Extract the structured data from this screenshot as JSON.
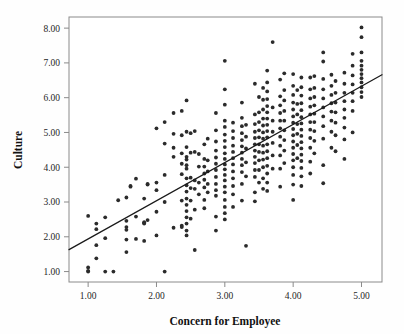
{
  "chart_data": {
    "type": "scatter",
    "title": "",
    "xlabel": "Concern for Employee",
    "ylabel": "Culture",
    "xlim": [
      0.72,
      5.3
    ],
    "ylim": [
      0.7,
      8.32
    ],
    "xticks": [
      1.0,
      2.0,
      3.0,
      4.0,
      5.0
    ],
    "xtick_labels": [
      "1.00",
      "2.00",
      "3.00",
      "4.00",
      "5.00"
    ],
    "yticks": [
      1.0,
      2.0,
      3.0,
      4.0,
      5.0,
      6.0,
      7.0,
      8.0
    ],
    "ytick_labels": [
      "1.00",
      "2.00",
      "3.00",
      "4.00",
      "5.00",
      "6.00",
      "7.00",
      "8.00"
    ],
    "grid": false,
    "legend": "none",
    "marker": {
      "shape": "circle",
      "size": 2.6,
      "color": "#2b2b2b"
    },
    "fit_line": {
      "type": "linear",
      "color": "#1a1a1a",
      "x_start": 0.72,
      "y_start": 1.63,
      "x_end": 5.3,
      "y_end": 6.66,
      "slope": 1.098,
      "intercept": 0.84
    },
    "points": [
      [
        1.0,
        2.6
      ],
      [
        1.0,
        1.12
      ],
      [
        1.0,
        1.02
      ],
      [
        1.0,
        1.0
      ],
      [
        1.12,
        2.38
      ],
      [
        1.12,
        2.22
      ],
      [
        1.12,
        1.76
      ],
      [
        1.12,
        1.38
      ],
      [
        1.25,
        2.56
      ],
      [
        1.25,
        1.96
      ],
      [
        1.25,
        1.0
      ],
      [
        1.37,
        1.0
      ],
      [
        1.44,
        3.05
      ],
      [
        1.56,
        3.13
      ],
      [
        1.56,
        2.46
      ],
      [
        1.56,
        2.28
      ],
      [
        1.56,
        2.2
      ],
      [
        1.56,
        1.92
      ],
      [
        1.56,
        1.56
      ],
      [
        1.62,
        3.46
      ],
      [
        1.62,
        3.44
      ],
      [
        1.7,
        3.67
      ],
      [
        1.7,
        2.58
      ],
      [
        1.7,
        1.94
      ],
      [
        1.82,
        3.1
      ],
      [
        1.82,
        2.42
      ],
      [
        1.82,
        2.4
      ],
      [
        1.82,
        2.38
      ],
      [
        1.82,
        1.88
      ],
      [
        1.87,
        3.52
      ],
      [
        1.87,
        3.5
      ],
      [
        1.87,
        2.48
      ],
      [
        2.0,
        5.12
      ],
      [
        2.0,
        3.56
      ],
      [
        2.0,
        3.34
      ],
      [
        2.0,
        2.72
      ],
      [
        2.0,
        2.04
      ],
      [
        2.12,
        5.3
      ],
      [
        2.12,
        4.68
      ],
      [
        2.12,
        3.78
      ],
      [
        2.12,
        3.0
      ],
      [
        2.12,
        1.0
      ],
      [
        2.25,
        5.56
      ],
      [
        2.25,
        4.96
      ],
      [
        2.25,
        4.56
      ],
      [
        2.25,
        4.3
      ],
      [
        2.25,
        2.26
      ],
      [
        2.37,
        5.62
      ],
      [
        2.37,
        4.92
      ],
      [
        2.37,
        4.4
      ],
      [
        2.37,
        4.1
      ],
      [
        2.37,
        3.8
      ],
      [
        2.37,
        3.04
      ],
      [
        2.37,
        2.32
      ],
      [
        2.37,
        2.28
      ],
      [
        2.44,
        5.92
      ],
      [
        2.44,
        5.02
      ],
      [
        2.44,
        4.58
      ],
      [
        2.44,
        4.3
      ],
      [
        2.44,
        4.22
      ],
      [
        2.44,
        4.06
      ],
      [
        2.44,
        3.96
      ],
      [
        2.44,
        3.68
      ],
      [
        2.44,
        3.48
      ],
      [
        2.44,
        3.3
      ],
      [
        2.44,
        3.1
      ],
      [
        2.44,
        2.92
      ],
      [
        2.44,
        2.74
      ],
      [
        2.44,
        2.56
      ],
      [
        2.44,
        2.38
      ],
      [
        2.44,
        2.18
      ],
      [
        2.44,
        2.04
      ],
      [
        2.5,
        4.98
      ],
      [
        2.5,
        4.42
      ],
      [
        2.5,
        3.7
      ],
      [
        2.5,
        3.4
      ],
      [
        2.5,
        3.04
      ],
      [
        2.5,
        2.52
      ],
      [
        2.56,
        5.04
      ],
      [
        2.56,
        4.44
      ],
      [
        2.56,
        3.62
      ],
      [
        2.56,
        3.38
      ],
      [
        2.56,
        2.78
      ],
      [
        2.56,
        1.62
      ],
      [
        2.62,
        4.38
      ],
      [
        2.62,
        4.02
      ],
      [
        2.62,
        3.56
      ],
      [
        2.62,
        3.22
      ],
      [
        2.7,
        4.66
      ],
      [
        2.7,
        4.24
      ],
      [
        2.7,
        4.02
      ],
      [
        2.7,
        3.82
      ],
      [
        2.7,
        3.64
      ],
      [
        2.7,
        3.42
      ],
      [
        2.7,
        3.06
      ],
      [
        2.7,
        2.82
      ],
      [
        2.75,
        4.82
      ],
      [
        2.75,
        4.2
      ],
      [
        2.75,
        3.88
      ],
      [
        2.75,
        3.52
      ],
      [
        2.75,
        3.28
      ],
      [
        2.87,
        5.56
      ],
      [
        2.87,
        5.06
      ],
      [
        2.87,
        4.74
      ],
      [
        2.87,
        4.48
      ],
      [
        2.87,
        4.28
      ],
      [
        2.87,
        4.1
      ],
      [
        2.87,
        3.92
      ],
      [
        2.87,
        3.72
      ],
      [
        2.87,
        3.52
      ],
      [
        2.87,
        3.34
      ],
      [
        2.87,
        3.18
      ],
      [
        2.87,
        2.58
      ],
      [
        2.87,
        2.18
      ],
      [
        3.0,
        7.06
      ],
      [
        3.0,
        6.24
      ],
      [
        3.0,
        5.8
      ],
      [
        3.0,
        5.34
      ],
      [
        3.0,
        5.16
      ],
      [
        3.0,
        4.94
      ],
      [
        3.0,
        4.76
      ],
      [
        3.0,
        4.58
      ],
      [
        3.0,
        4.4
      ],
      [
        3.0,
        4.24
      ],
      [
        3.0,
        4.08
      ],
      [
        3.0,
        3.94
      ],
      [
        3.0,
        3.78
      ],
      [
        3.0,
        3.62
      ],
      [
        3.0,
        3.44
      ],
      [
        3.0,
        3.28
      ],
      [
        3.0,
        3.06
      ],
      [
        3.0,
        2.86
      ],
      [
        3.0,
        2.68
      ],
      [
        3.0,
        2.5
      ],
      [
        3.12,
        5.28
      ],
      [
        3.12,
        5.04
      ],
      [
        3.12,
        4.84
      ],
      [
        3.12,
        4.62
      ],
      [
        3.12,
        4.44
      ],
      [
        3.12,
        4.26
      ],
      [
        3.12,
        4.08
      ],
      [
        3.12,
        3.88
      ],
      [
        3.12,
        3.68
      ],
      [
        3.12,
        3.46
      ],
      [
        3.12,
        3.22
      ],
      [
        3.12,
        2.86
      ],
      [
        3.25,
        5.86
      ],
      [
        3.25,
        5.42
      ],
      [
        3.25,
        5.18
      ],
      [
        3.25,
        4.98
      ],
      [
        3.25,
        4.78
      ],
      [
        3.25,
        4.6
      ],
      [
        3.25,
        4.42
      ],
      [
        3.25,
        4.24
      ],
      [
        3.25,
        4.06
      ],
      [
        3.25,
        3.86
      ],
      [
        3.25,
        3.52
      ],
      [
        3.25,
        3.04
      ],
      [
        3.31,
        5.22
      ],
      [
        3.31,
        4.88
      ],
      [
        3.31,
        4.54
      ],
      [
        3.31,
        4.14
      ],
      [
        3.31,
        3.74
      ],
      [
        3.31,
        1.74
      ],
      [
        3.44,
        6.4
      ],
      [
        3.44,
        5.52
      ],
      [
        3.44,
        5.24
      ],
      [
        3.44,
        5.02
      ],
      [
        3.44,
        4.84
      ],
      [
        3.44,
        4.66
      ],
      [
        3.44,
        4.48
      ],
      [
        3.44,
        4.3
      ],
      [
        3.44,
        4.12
      ],
      [
        3.44,
        3.92
      ],
      [
        3.44,
        3.72
      ],
      [
        3.44,
        3.28
      ],
      [
        3.44,
        3.02
      ],
      [
        3.5,
        6.02
      ],
      [
        3.5,
        5.58
      ],
      [
        3.5,
        5.3
      ],
      [
        3.5,
        5.06
      ],
      [
        3.5,
        4.86
      ],
      [
        3.5,
        4.66
      ],
      [
        3.5,
        4.44
      ],
      [
        3.5,
        4.2
      ],
      [
        3.5,
        3.92
      ],
      [
        3.5,
        3.56
      ],
      [
        3.56,
        6.28
      ],
      [
        3.56,
        5.94
      ],
      [
        3.56,
        5.66
      ],
      [
        3.56,
        5.4
      ],
      [
        3.56,
        5.2
      ],
      [
        3.56,
        5.0
      ],
      [
        3.56,
        4.82
      ],
      [
        3.56,
        4.62
      ],
      [
        3.56,
        4.42
      ],
      [
        3.56,
        4.22
      ],
      [
        3.56,
        4.0
      ],
      [
        3.56,
        3.68
      ],
      [
        3.56,
        3.38
      ],
      [
        3.62,
        6.78
      ],
      [
        3.62,
        6.44
      ],
      [
        3.62,
        6.18
      ],
      [
        3.62,
        5.96
      ],
      [
        3.62,
        5.76
      ],
      [
        3.62,
        5.58
      ],
      [
        3.62,
        5.4
      ],
      [
        3.62,
        5.22
      ],
      [
        3.62,
        5.04
      ],
      [
        3.62,
        4.86
      ],
      [
        3.62,
        4.66
      ],
      [
        3.62,
        4.46
      ],
      [
        3.62,
        4.26
      ],
      [
        3.62,
        4.04
      ],
      [
        3.62,
        3.82
      ],
      [
        3.62,
        3.56
      ],
      [
        3.62,
        3.32
      ],
      [
        3.7,
        7.6
      ],
      [
        3.7,
        5.72
      ],
      [
        3.7,
        5.34
      ],
      [
        3.7,
        5.02
      ],
      [
        3.7,
        4.7
      ],
      [
        3.7,
        4.34
      ],
      [
        3.7,
        3.96
      ],
      [
        3.81,
        6.52
      ],
      [
        3.81,
        6.04
      ],
      [
        3.81,
        5.78
      ],
      [
        3.81,
        5.56
      ],
      [
        3.81,
        5.34
      ],
      [
        3.81,
        5.12
      ],
      [
        3.81,
        4.88
      ],
      [
        3.81,
        4.62
      ],
      [
        3.81,
        4.34
      ],
      [
        3.81,
        3.96
      ],
      [
        3.81,
        3.44
      ],
      [
        3.87,
        6.7
      ],
      [
        3.87,
        6.22
      ],
      [
        3.87,
        5.92
      ],
      [
        3.87,
        5.62
      ],
      [
        3.87,
        5.34
      ],
      [
        3.87,
        5.06
      ],
      [
        3.87,
        4.78
      ],
      [
        3.87,
        4.48
      ],
      [
        3.87,
        4.12
      ],
      [
        4.0,
        6.68
      ],
      [
        4.0,
        6.34
      ],
      [
        4.0,
        6.08
      ],
      [
        4.0,
        5.86
      ],
      [
        4.0,
        5.66
      ],
      [
        4.0,
        5.46
      ],
      [
        4.0,
        5.28
      ],
      [
        4.0,
        5.1
      ],
      [
        4.0,
        4.92
      ],
      [
        4.0,
        4.74
      ],
      [
        4.0,
        4.56
      ],
      [
        4.0,
        4.38
      ],
      [
        4.0,
        4.2
      ],
      [
        4.0,
        4.0
      ],
      [
        4.0,
        3.78
      ],
      [
        4.0,
        3.5
      ],
      [
        4.0,
        3.06
      ],
      [
        4.06,
        6.22
      ],
      [
        4.06,
        5.82
      ],
      [
        4.06,
        5.52
      ],
      [
        4.06,
        5.24
      ],
      [
        4.06,
        4.96
      ],
      [
        4.06,
        4.64
      ],
      [
        4.06,
        4.26
      ],
      [
        4.12,
        6.58
      ],
      [
        4.12,
        6.3
      ],
      [
        4.12,
        6.06
      ],
      [
        4.12,
        5.84
      ],
      [
        4.12,
        5.64
      ],
      [
        4.12,
        5.44
      ],
      [
        4.12,
        5.26
      ],
      [
        4.12,
        5.08
      ],
      [
        4.12,
        4.9
      ],
      [
        4.12,
        4.72
      ],
      [
        4.12,
        4.54
      ],
      [
        4.12,
        4.36
      ],
      [
        4.12,
        4.18
      ],
      [
        4.12,
        3.98
      ],
      [
        4.12,
        3.74
      ],
      [
        4.12,
        3.46
      ],
      [
        4.25,
        6.58
      ],
      [
        4.25,
        6.24
      ],
      [
        4.25,
        5.98
      ],
      [
        4.25,
        5.74
      ],
      [
        4.25,
        5.52
      ],
      [
        4.25,
        5.3
      ],
      [
        4.25,
        5.08
      ],
      [
        4.25,
        4.84
      ],
      [
        4.25,
        4.56
      ],
      [
        4.25,
        4.16
      ],
      [
        4.25,
        3.82
      ],
      [
        4.31,
        6.62
      ],
      [
        4.31,
        6.28
      ],
      [
        4.31,
        6.02
      ],
      [
        4.31,
        5.78
      ],
      [
        4.31,
        5.54
      ],
      [
        4.31,
        5.3
      ],
      [
        4.31,
        5.04
      ],
      [
        4.31,
        4.76
      ],
      [
        4.31,
        4.4
      ],
      [
        4.44,
        7.3
      ],
      [
        4.44,
        7.04
      ],
      [
        4.44,
        6.54
      ],
      [
        4.44,
        6.24
      ],
      [
        4.44,
        5.98
      ],
      [
        4.44,
        5.72
      ],
      [
        4.44,
        5.46
      ],
      [
        4.44,
        5.18
      ],
      [
        4.44,
        4.82
      ],
      [
        4.44,
        4.06
      ],
      [
        4.44,
        3.54
      ],
      [
        4.56,
        6.66
      ],
      [
        4.56,
        6.34
      ],
      [
        4.56,
        6.08
      ],
      [
        4.56,
        5.84
      ],
      [
        4.56,
        5.6
      ],
      [
        4.56,
        5.34
      ],
      [
        4.56,
        5.02
      ],
      [
        4.56,
        4.56
      ],
      [
        4.62,
        6.48
      ],
      [
        4.62,
        6.14
      ],
      [
        4.62,
        5.86
      ],
      [
        4.62,
        5.58
      ],
      [
        4.62,
        5.28
      ],
      [
        4.62,
        4.92
      ],
      [
        4.62,
        4.46
      ],
      [
        4.75,
        6.72
      ],
      [
        4.75,
        6.4
      ],
      [
        4.75,
        6.14
      ],
      [
        4.75,
        5.9
      ],
      [
        4.75,
        5.66
      ],
      [
        4.75,
        5.42
      ],
      [
        4.75,
        5.14
      ],
      [
        4.75,
        4.8
      ],
      [
        4.75,
        4.24
      ],
      [
        4.87,
        7.26
      ],
      [
        4.87,
        6.92
      ],
      [
        4.87,
        6.64
      ],
      [
        4.87,
        6.38
      ],
      [
        4.87,
        6.14
      ],
      [
        4.87,
        5.9
      ],
      [
        4.87,
        5.62
      ],
      [
        4.87,
        5.0
      ],
      [
        5.0,
        8.02
      ],
      [
        5.0,
        7.74
      ],
      [
        5.0,
        7.3
      ],
      [
        5.0,
        7.06
      ],
      [
        5.0,
        6.92
      ],
      [
        5.0,
        6.8
      ],
      [
        5.0,
        6.68
      ],
      [
        5.0,
        6.56
      ],
      [
        5.0,
        6.44
      ],
      [
        5.0,
        6.3
      ],
      [
        5.0,
        6.16
      ],
      [
        5.0,
        6.02
      ]
    ]
  }
}
